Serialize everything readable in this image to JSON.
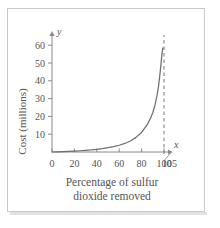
{
  "figure": {
    "caption_lines": [
      "Percentage of sulfur",
      "dioxide removed"
    ],
    "y_axis_title": "Cost (millions)",
    "x_axis_name": "x",
    "y_axis_name": "y",
    "colors": {
      "curve": "#6e6e6e",
      "axis": "#8a8a8a",
      "asymptote": "#7a7a7a",
      "text": "#555555",
      "frame": "#c9c9c9"
    }
  },
  "chart_data": {
    "type": "line",
    "title": "",
    "xlabel": "Percentage of sulfur dioxide removed",
    "ylabel": "Cost (millions)",
    "xlim": [
      0,
      108
    ],
    "ylim": [
      0,
      68
    ],
    "xticks": [
      0,
      20,
      40,
      60,
      80,
      100,
      105
    ],
    "yticks": [
      10,
      20,
      30,
      40,
      50,
      60
    ],
    "xtick_labels": [
      "0",
      "20",
      "40",
      "60",
      "80",
      "100",
      "105"
    ],
    "ytick_labels": [
      "10",
      "20",
      "30",
      "40",
      "50",
      "60"
    ],
    "grid": false,
    "legend": null,
    "annotations": [
      {
        "type": "vertical-asymptote",
        "x": 100,
        "style": "dashed",
        "label": ""
      }
    ],
    "series": [
      {
        "name": "Cost of removal",
        "x": [
          0,
          5,
          10,
          15,
          20,
          25,
          30,
          35,
          40,
          45,
          50,
          55,
          60,
          65,
          70,
          75,
          80,
          85,
          88,
          90,
          92,
          94,
          95,
          96,
          97,
          98,
          98.5,
          99
        ],
        "y": [
          0.0,
          0.1,
          0.2,
          0.35,
          0.5,
          0.7,
          0.9,
          1.15,
          1.5,
          1.9,
          2.4,
          3.0,
          3.8,
          4.8,
          6.2,
          8.2,
          11.0,
          15.4,
          19.0,
          22.2,
          26.5,
          32.5,
          36.5,
          41.5,
          47.5,
          54.0,
          56.5,
          58.5
        ]
      }
    ]
  }
}
